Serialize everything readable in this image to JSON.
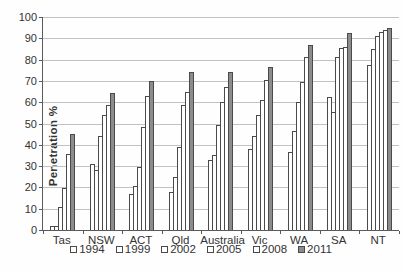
{
  "chart_data": {
    "type": "bar",
    "title": "",
    "xlabel": "",
    "ylabel": "Penetration %",
    "categories": [
      "Tas",
      "NSW",
      "ACT",
      "Qld",
      "Australia",
      "Vic",
      "WA",
      "SA",
      "NT"
    ],
    "series": [
      {
        "name": "1994",
        "values": [
          2,
          31,
          17,
          18,
          33,
          38,
          36.5,
          62.5,
          77.5
        ]
      },
      {
        "name": "1999",
        "values": [
          2,
          28,
          20.5,
          25,
          35,
          44,
          46.5,
          55.5,
          85
        ]
      },
      {
        "name": "2002",
        "values": [
          11,
          44,
          29.5,
          39,
          49.5,
          54,
          60,
          81,
          91
        ]
      },
      {
        "name": "2005",
        "values": [
          19.5,
          54,
          48.5,
          58.5,
          60,
          61,
          69.5,
          85.5,
          93
        ]
      },
      {
        "name": "2008",
        "values": [
          35.5,
          58.5,
          63,
          65,
          67,
          70.5,
          81,
          86,
          94
        ]
      },
      {
        "name": "2011",
        "values": [
          45,
          64.5,
          70,
          74,
          74,
          76.5,
          87,
          92.5,
          95
        ]
      }
    ],
    "ylim": [
      0,
      100
    ],
    "ytick_step": 10,
    "grid": "horizontal",
    "legend_position": "bottom",
    "colors": {
      "light_fill": "#ffffff",
      "dark_fill": "#8c8c8c",
      "dark_series": "2011",
      "bar_border": "#4a4a4a",
      "grid": "#c2c2c2",
      "axis": "#5a5a5a"
    }
  }
}
